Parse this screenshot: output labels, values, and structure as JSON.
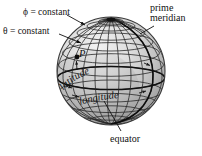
{
  "figure": {
    "type": "diagram",
    "background_color": "#ffffff",
    "sphere": {
      "center_x": 111,
      "center_y": 71,
      "radius": 54,
      "fill_light": "#e8e8e8",
      "fill_mid": "#c9c9c9",
      "fill_shadow": "#9a9a9a",
      "outline_color": "#3a3a3a",
      "grid_color": "#2a2a2a",
      "meridian_count": 18,
      "parallel_count": 9,
      "pole_marker": "north-pole-convergence"
    },
    "labels": {
      "phi_constant": "ϕ = constant",
      "theta_constant": "θ = constant",
      "prime_meridian_line1": "prime",
      "prime_meridian_line2": "meridian",
      "latitude": "latitude",
      "longitude": "longitude",
      "equator": "equator",
      "point": "P"
    },
    "leader_lines": [
      {
        "name": "phi-leader",
        "from": [
          66,
          14
        ],
        "to": [
          84,
          25
        ]
      },
      {
        "name": "theta-leader",
        "from": [
          58,
          33
        ],
        "to": [
          80,
          42
        ]
      },
      {
        "name": "prime-meridian-leader",
        "from": [
          152,
          25
        ],
        "to": [
          139,
          33
        ]
      },
      {
        "name": "equator-leader",
        "from": [
          120,
          131
        ],
        "to": [
          103,
          102
        ]
      },
      {
        "name": "point-p-leader",
        "from": [
          78,
          71
        ],
        "to": [
          76,
          63
        ]
      }
    ]
  }
}
